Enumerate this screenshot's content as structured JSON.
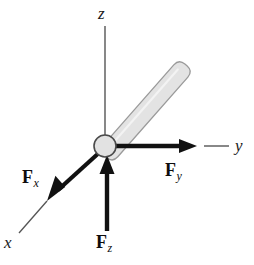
{
  "figure": {
    "kind": "free-body-force-diagram",
    "background_color": "#ffffff"
  },
  "axes": [
    {
      "key": "z",
      "label": "z",
      "direction": "up",
      "line": {
        "x1": 105,
        "y1": 26,
        "x2": 105,
        "y2": 140
      },
      "stroke": "#555555",
      "stroke_width": 1.4,
      "label_pos": {
        "x": 98,
        "y": 5
      }
    },
    {
      "key": "y",
      "label": "y",
      "direction": "right",
      "line": {
        "x1": 204,
        "y1": 146,
        "x2": 229,
        "y2": 146
      },
      "stroke": "#555555",
      "stroke_width": 1.4,
      "label_pos": {
        "x": 235,
        "y": 137
      }
    },
    {
      "key": "x",
      "label": "x",
      "direction": "down-left",
      "line": {
        "x1": 47,
        "y1": 201,
        "x2": 19,
        "y2": 233
      },
      "stroke": "#555555",
      "stroke_width": 1.4,
      "label_pos": {
        "x": 4,
        "y": 234
      }
    }
  ],
  "origin": {
    "name": "joint-origin",
    "cx": 105,
    "cy": 146,
    "r": 11,
    "fill": "#e2e2e2",
    "stroke": "#4a4a4a",
    "stroke_width": 1.6
  },
  "rod": {
    "name": "attached-rod",
    "fill": "#e3e3e3",
    "stroke": "#9a9a9a",
    "stroke_width": 1.3,
    "angle_deg": 45,
    "base": {
      "x": 109,
      "y": 141
    },
    "tip": {
      "x": 181,
      "y": 72
    },
    "base_half_width": 5,
    "tip_half_width": 7
  },
  "forces": [
    {
      "key": "Fx",
      "symbol": "F",
      "subscript": "x",
      "direction": "down-left",
      "color": "#111111",
      "stroke_width": 4.2,
      "shaft": {
        "x1": 100,
        "y1": 152,
        "x2": 57,
        "y2": 191
      },
      "tip": {
        "x": 47,
        "y": 201
      },
      "head_length": 17,
      "head_half_width": 7,
      "label_pos": {
        "x": 22,
        "y": 168
      }
    },
    {
      "key": "Fy",
      "symbol": "F",
      "subscript": "y",
      "direction": "right",
      "color": "#111111",
      "stroke_width": 4.6,
      "shaft": {
        "x1": 113,
        "y1": 146,
        "x2": 180,
        "y2": 146
      },
      "tip": {
        "x": 197,
        "y": 146
      },
      "head_length": 18,
      "head_half_width": 7.5,
      "label_pos": {
        "x": 165,
        "y": 161
      }
    },
    {
      "key": "Fz",
      "symbol": "F",
      "subscript": "z",
      "direction": "up",
      "color": "#111111",
      "stroke_width": 4.4,
      "shaft": {
        "x1": 107,
        "y1": 231,
        "x2": 107,
        "y2": 172
      },
      "tip": {
        "x": 107,
        "y": 155
      },
      "head_length": 18,
      "head_half_width": 7.5,
      "label_pos": {
        "x": 96,
        "y": 233
      }
    }
  ],
  "labels": {
    "axis_z": "z",
    "axis_y": "y",
    "axis_x": "x",
    "force_x_symbol": "F",
    "force_x_sub": "x",
    "force_y_symbol": "F",
    "force_y_sub": "y",
    "force_z_symbol": "F",
    "force_z_sub": "z"
  }
}
